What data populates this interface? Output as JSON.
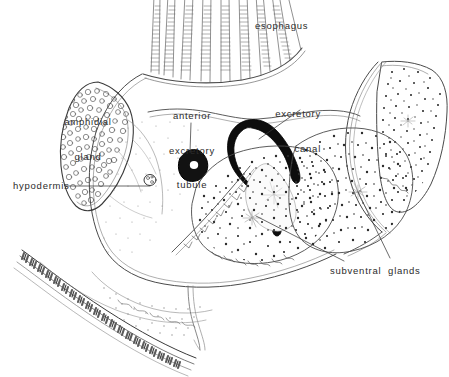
{
  "figure": {
    "background_color": "#ffffff",
    "ink_color": "#2b2b2b",
    "width": 449,
    "height": 377
  },
  "labels": {
    "esophagus": {
      "text": "esophagus",
      "lines": [
        "esophagus"
      ],
      "x": 255,
      "y": 20,
      "align": "left"
    },
    "amphidial_gland": {
      "text": "amphidial gland",
      "lines": [
        "amphidial",
        "gland"
      ],
      "line1": "amphidial",
      "line2": "gland",
      "x": 46,
      "y": 93,
      "align": "center"
    },
    "anterior_excretory_tubule": {
      "text": "anterior excretory tubule",
      "lines": [
        "anterior",
        "excretory",
        "tubule"
      ],
      "line1": "anterior",
      "line2": "excretory",
      "line3": "tubule",
      "x": 157,
      "y": 87,
      "align": "center"
    },
    "excretory_canal": {
      "text": "excretory canal",
      "lines": [
        "excretory",
        "canal"
      ],
      "line1": "excretory",
      "line2": "canal",
      "x": 263,
      "y": 85,
      "align": "right"
    },
    "hypodermis": {
      "text": "hypodermis",
      "lines": [
        "hypodermis"
      ],
      "x": 13,
      "y": 180,
      "align": "left"
    },
    "subventral_glands": {
      "text": "subventral  glands",
      "lines": [
        "subventral  glands"
      ],
      "x": 330,
      "y": 265,
      "align": "left"
    }
  },
  "structures": {
    "esophagus_fibers": 9,
    "cuticle_striations": 60,
    "amphidial_gland_cells": 210,
    "subventral_gland_stipple": 520,
    "nuclei": 4
  }
}
